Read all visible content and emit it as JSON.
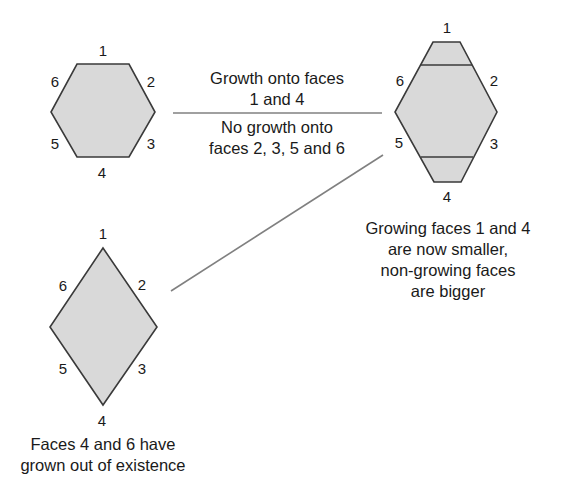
{
  "colors": {
    "fill": "#d9d9d9",
    "stroke": "#3a3a3a",
    "connector": "#808080",
    "text": "#1a1a1a"
  },
  "hexagon_initial": {
    "face_labels": {
      "f1": "1",
      "f2": "2",
      "f3": "3",
      "f4": "4",
      "f5": "5",
      "f6": "6"
    }
  },
  "hexagon_grown": {
    "face_labels": {
      "f1": "1",
      "f2": "2",
      "f3": "3",
      "f4": "4",
      "f5": "5",
      "f6": "6"
    },
    "caption": {
      "line1": "Growing faces 1 and 4",
      "line2": "are now smaller,",
      "line3": "non-growing faces",
      "line4": "are bigger"
    }
  },
  "diamond_final": {
    "face_labels": {
      "f1": "1",
      "f2": "2",
      "f3": "3",
      "f4": "4",
      "f5": "5",
      "f6": "6"
    },
    "caption": {
      "line1": "Faces 4 and 6 have",
      "line2": "grown out of existence"
    }
  },
  "growth_label": {
    "above": {
      "line1": "Growth onto faces",
      "line2": "1 and 4"
    },
    "below": {
      "line1": "No growth onto",
      "line2": "faces 2, 3, 5 and 6"
    }
  }
}
